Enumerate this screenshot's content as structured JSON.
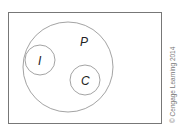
{
  "diagram": {
    "type": "venn",
    "universe": {
      "label": ""
    },
    "sets": [
      {
        "id": "P",
        "label": "P",
        "contains": [
          "I",
          "C"
        ]
      },
      {
        "id": "I",
        "label": "I",
        "subset_of": "P"
      },
      {
        "id": "C",
        "label": "C",
        "subset_of": "P"
      }
    ],
    "credit": "© Cengage Learning 2014",
    "colors": {
      "stroke": "#888888",
      "text": "#222222"
    }
  }
}
